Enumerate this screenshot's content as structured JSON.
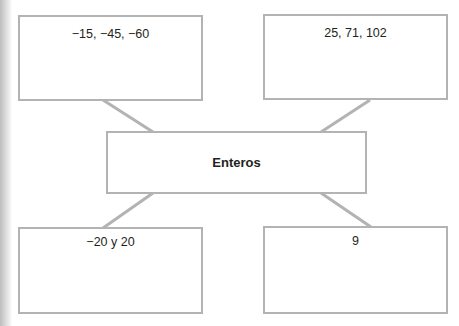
{
  "diagram": {
    "type": "concept-map",
    "center": {
      "label": "Enteros"
    },
    "nodes": [
      {
        "position": "top-left",
        "label": "−15, −45, −60"
      },
      {
        "position": "top-right",
        "label": "25, 71, 102"
      },
      {
        "position": "bottom-left",
        "label": "−20 y 20"
      },
      {
        "position": "bottom-right",
        "label": "9"
      }
    ],
    "colors": {
      "border": "#b3b3b3",
      "connector": "#b3b3b3",
      "text": "#231f20",
      "background": "#ffffff"
    }
  }
}
